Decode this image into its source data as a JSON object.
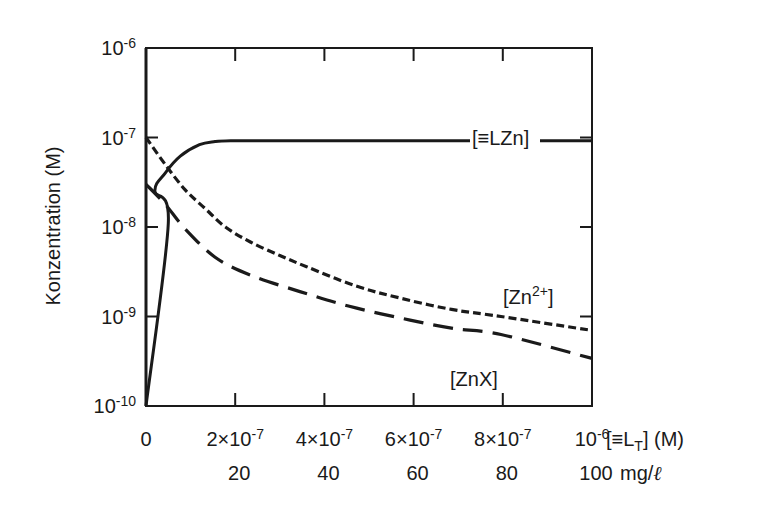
{
  "chart_data": {
    "type": "line",
    "title": "",
    "xlabel": "[≡L_T] (M)",
    "xlabel_secondary": "mg/ℓ",
    "ylabel": "Konzentration (M)",
    "yscale": "log",
    "xlim": [
      0,
      1e-06
    ],
    "ylim": [
      1e-10,
      1e-06
    ],
    "grid": false,
    "legend": "inline labels",
    "x_ticks": [
      {
        "value": 0,
        "label": "0",
        "label2": ""
      },
      {
        "value": 2e-07,
        "label": "2×10",
        "exp": "-7",
        "label2": "20"
      },
      {
        "value": 4e-07,
        "label": "4×10",
        "exp": "-7",
        "label2": "40"
      },
      {
        "value": 6e-07,
        "label": "6×10",
        "exp": "-7",
        "label2": "60"
      },
      {
        "value": 8e-07,
        "label": "8×10",
        "exp": "-7",
        "label2": "80"
      },
      {
        "value": 1e-06,
        "label": "10",
        "exp": "-6",
        "label2": "100"
      }
    ],
    "y_ticks": [
      {
        "value": 1e-06,
        "base": "10",
        "exp": "-6"
      },
      {
        "value": 1e-07,
        "base": "10",
        "exp": "-7"
      },
      {
        "value": 1e-08,
        "base": "10",
        "exp": "-8"
      },
      {
        "value": 1e-09,
        "base": "10",
        "exp": "-9"
      },
      {
        "value": 1e-10,
        "base": "10",
        "exp": "-10"
      }
    ],
    "series": [
      {
        "name": "[≡LZn]",
        "style": "solid",
        "x": [
          0,
          5e-08,
          2e-08,
          4.3e-08,
          7.7e-08,
          1.2e-07,
          1.55e-07,
          1.9e-07,
          3e-07,
          5e-07,
          7e-07,
          1e-06
        ],
        "y": [
          1e-10,
          1.1e-08,
          2.5e-08,
          4e-08,
          6.2e-08,
          8.3e-08,
          9e-08,
          9.2e-08,
          9.2e-08,
          9.2e-08,
          9.2e-08,
          9.2e-08
        ]
      },
      {
        "name": "[Zn2+]",
        "style": "dotted",
        "x": [
          0,
          4.3e-08,
          8.8e-08,
          1.33e-07,
          1.78e-07,
          2.34e-07,
          3e-07,
          3.6e-07,
          4.7e-07,
          5.71e-07,
          6.85e-07,
          7.96e-07,
          1e-06
        ],
        "y": [
          1e-07,
          5e-08,
          2.6e-08,
          1.6e-08,
          1e-08,
          6.8e-09,
          4.8e-09,
          3.6e-09,
          2.2e-09,
          1.6e-09,
          1.2e-09,
          1e-09,
          7e-10
        ]
      },
      {
        "name": "[ZnX]",
        "style": "dashed",
        "x": [
          0,
          4.3e-08,
          8.8e-08,
          1.55e-07,
          2.34e-07,
          3.45e-07,
          4.56e-07,
          5.71e-07,
          6.85e-07,
          7.96e-07,
          1e-06
        ],
        "y": [
          3e-08,
          1.8e-08,
          9.5e-09,
          4.6e-09,
          2.9e-09,
          1.9e-09,
          1.3e-09,
          9.6e-10,
          7.4e-10,
          6.3e-10,
          3.4e-10
        ]
      }
    ],
    "annotations": [
      {
        "text": "[≡LZn]",
        "series": "[≡LZn]"
      },
      {
        "text": "[Zn2+]",
        "series": "[Zn2+]"
      },
      {
        "text": "[ZnX]",
        "series": "[ZnX]"
      }
    ]
  },
  "labels": {
    "ylabel": "Konzentration (M)",
    "xlabel_main": "[≡L",
    "xlabel_sub": "T",
    "xlabel_tail": "] (M)",
    "xlabel_secondary": "mg/",
    "xlabel_secondary_unit": "ℓ",
    "lzn": "[≡LZn]",
    "zn_base": "[Zn",
    "zn_sup": "2+",
    "zn_close": "]",
    "znx": "[ZnX]"
  }
}
